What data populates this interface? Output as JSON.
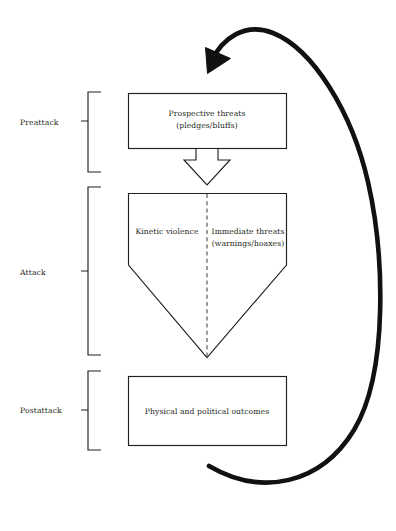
{
  "diagram": {
    "background_color": "#ffffff",
    "line_color": "#231f20",
    "loop_color": "#111111",
    "phases": [
      {
        "key": "preattack",
        "label": "Preattack",
        "shape": "rectangle",
        "content_lines": [
          "Prospective threats",
          "(pledges/bluffs)"
        ]
      },
      {
        "key": "attack",
        "label": "Attack",
        "shape": "pentagon-shield",
        "divider": "dashed-vertical",
        "left_cell": {
          "content_lines": [
            "Kinetic violence"
          ]
        },
        "right_cell": {
          "content_lines": [
            "Immediate threats",
            "(warnings/hoaxes)"
          ]
        }
      },
      {
        "key": "postattack",
        "label": "Postattack",
        "shape": "rectangle",
        "content_lines": [
          "Physical and political outcomes"
        ]
      }
    ],
    "connectors": [
      {
        "key": "preattack-to-attack",
        "type": "hollow-down-arrow",
        "from": "preattack",
        "to": "attack",
        "label": ""
      },
      {
        "key": "feedback-loop",
        "type": "curved-feedback-arrow",
        "from": "postattack",
        "to": "preattack",
        "label": ""
      }
    ]
  }
}
